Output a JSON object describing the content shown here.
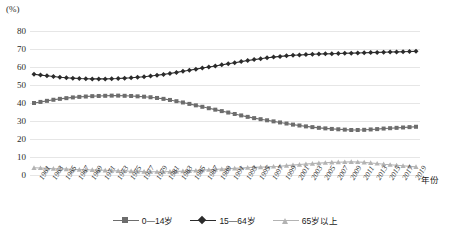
{
  "chart_data": {
    "type": "line",
    "title": "",
    "subtitle": "",
    "xlabel": "年份",
    "ylabel": "(%)",
    "yunit": "(%)",
    "ylim": [
      0,
      80
    ],
    "yticks": [
      0,
      10,
      20,
      30,
      40,
      50,
      60,
      70,
      80
    ],
    "grid": true,
    "legend_position": "bottom",
    "x": [
      1961,
      1962,
      1963,
      1964,
      1965,
      1966,
      1967,
      1968,
      1969,
      1970,
      1971,
      1972,
      1973,
      1974,
      1975,
      1976,
      1977,
      1978,
      1979,
      1980,
      1981,
      1982,
      1983,
      1984,
      1985,
      1986,
      1987,
      1988,
      1989,
      1990,
      1991,
      1992,
      1993,
      1994,
      1995,
      1996,
      1997,
      1998,
      1999,
      2000,
      2001,
      2002,
      2003,
      2004,
      2005,
      2006,
      2007,
      2008,
      2009,
      2010,
      2011,
      2012,
      2013,
      2014,
      2015,
      2016,
      2017,
      2018,
      2019,
      2020
    ],
    "xtick_labels": [
      "1961",
      "1963",
      "1965",
      "1967",
      "1969",
      "1971",
      "1973",
      "1975",
      "1977",
      "1979",
      "1981",
      "1983",
      "1985",
      "1987",
      "1989",
      "1991",
      "1993",
      "1995",
      "1997",
      "1999",
      "2001",
      "2003",
      "2005",
      "2007",
      "2009",
      "2011",
      "2013",
      "2015",
      "2017",
      "2019"
    ],
    "series": [
      {
        "name": "0—14岁",
        "marker": "square",
        "color": "#6d6d6d",
        "values": [
          40.0,
          40.6,
          41.2,
          41.8,
          42.3,
          42.7,
          43.1,
          43.4,
          43.6,
          43.8,
          43.9,
          44.0,
          44.1,
          44.1,
          44.0,
          43.9,
          43.7,
          43.5,
          43.2,
          42.8,
          42.3,
          41.7,
          41.0,
          40.3,
          39.5,
          38.7,
          37.9,
          37.1,
          36.3,
          35.5,
          34.7,
          33.9,
          33.1,
          32.3,
          31.6,
          31.0,
          30.4,
          29.8,
          29.2,
          28.6,
          28.0,
          27.5,
          27.0,
          26.6,
          26.2,
          25.9,
          25.6,
          25.4,
          25.2,
          25.0,
          25.0,
          25.1,
          25.3,
          25.5,
          25.8,
          26.0,
          26.2,
          26.4,
          26.6,
          26.8
        ]
      },
      {
        "name": "15—64岁",
        "marker": "diamond",
        "color": "#2b2b2b",
        "values": [
          56.0,
          55.5,
          55.1,
          54.7,
          54.3,
          54.0,
          53.8,
          53.6,
          53.5,
          53.4,
          53.4,
          53.4,
          53.5,
          53.6,
          53.8,
          54.0,
          54.3,
          54.6,
          55.0,
          55.4,
          55.9,
          56.4,
          57.0,
          57.6,
          58.2,
          58.8,
          59.4,
          60.0,
          60.6,
          61.2,
          61.8,
          62.4,
          63.0,
          63.6,
          64.1,
          64.6,
          65.1,
          65.5,
          65.9,
          66.2,
          66.5,
          66.7,
          66.9,
          67.1,
          67.2,
          67.3,
          67.4,
          67.5,
          67.6,
          67.7,
          67.8,
          67.9,
          68.0,
          68.1,
          68.2,
          68.3,
          68.4,
          68.5,
          68.6,
          68.7
        ]
      },
      {
        "name": "65岁以上",
        "marker": "triangle",
        "color": "#b3b3b3",
        "values": [
          4.0,
          3.9,
          3.7,
          3.5,
          3.4,
          3.3,
          3.1,
          3.0,
          2.9,
          2.8,
          2.7,
          2.6,
          2.4,
          2.3,
          2.2,
          2.1,
          2.0,
          1.9,
          1.8,
          1.8,
          1.8,
          1.9,
          2.0,
          2.1,
          2.3,
          2.5,
          2.7,
          2.9,
          3.1,
          3.3,
          3.5,
          3.7,
          3.9,
          4.1,
          4.3,
          4.4,
          4.5,
          4.7,
          4.9,
          5.2,
          5.5,
          5.8,
          6.1,
          6.3,
          6.6,
          6.8,
          7.0,
          7.1,
          7.2,
          7.3,
          7.2,
          7.0,
          6.7,
          6.4,
          6.0,
          5.7,
          5.4,
          5.1,
          4.8,
          4.5
        ]
      }
    ]
  },
  "legend": {
    "items": [
      {
        "label": "0—14岁"
      },
      {
        "label": "15—64岁"
      },
      {
        "label": "65岁以上"
      }
    ]
  },
  "axes": {
    "y_unit": "(%)",
    "x_title": "年份"
  }
}
